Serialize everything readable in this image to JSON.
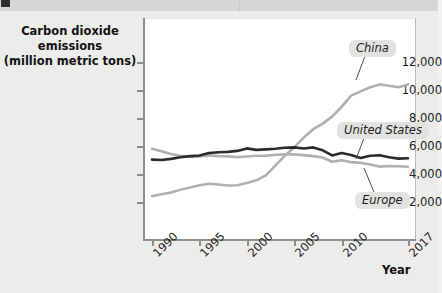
{
  "figure": {
    "y_axis_title_line1": "Carbon dioxide emissions",
    "y_axis_title_line2": "(million metric tons)",
    "x_axis_title": "Year"
  },
  "callouts": {
    "china": "China",
    "united_states": "United States",
    "europe": "Europe"
  },
  "chart_data": {
    "type": "line",
    "title": "Carbon dioxide emissions (million metric tons)",
    "xlabel": "Year",
    "ylabel": "Carbon dioxide emissions (million metric tons)",
    "xlim": [
      1990,
      2017
    ],
    "ylim": [
      0,
      13000
    ],
    "xticks": [
      1990,
      1995,
      2000,
      2005,
      2010,
      2017
    ],
    "xtick_labels": [
      "1990",
      "1995",
      "2000",
      "2005",
      "2010",
      "2017"
    ],
    "yticks": [
      2000,
      4000,
      6000,
      8000,
      10000,
      12000
    ],
    "ytick_labels": [
      "2,000",
      "4,000",
      "6,000",
      "8,000",
      "10,000",
      "12,000"
    ],
    "grid": false,
    "legend_position": "inline-callouts",
    "x": [
      1990,
      1991,
      1992,
      1993,
      1994,
      1995,
      1996,
      1997,
      1998,
      1999,
      2000,
      2001,
      2002,
      2003,
      2004,
      2005,
      2006,
      2007,
      2008,
      2009,
      2010,
      2011,
      2012,
      2013,
      2014,
      2015,
      2016,
      2017
    ],
    "series": [
      {
        "name": "China",
        "color": "#b0b0ae",
        "values": [
          2420,
          2550,
          2680,
          2880,
          3030,
          3200,
          3300,
          3250,
          3180,
          3200,
          3350,
          3550,
          3900,
          4600,
          5300,
          5900,
          6600,
          7200,
          7600,
          8100,
          8800,
          9600,
          9900,
          10200,
          10400,
          10300,
          10200,
          10400
        ]
      },
      {
        "name": "United States",
        "color": "#2b2b2b",
        "values": [
          5030,
          5000,
          5080,
          5200,
          5280,
          5320,
          5500,
          5560,
          5580,
          5650,
          5830,
          5720,
          5760,
          5800,
          5870,
          5900,
          5820,
          5900,
          5690,
          5330,
          5500,
          5350,
          5150,
          5300,
          5340,
          5200,
          5100,
          5130
        ]
      },
      {
        "name": "Europe",
        "color": "#b0b0ae",
        "values": [
          5800,
          5620,
          5420,
          5300,
          5220,
          5250,
          5330,
          5280,
          5260,
          5210,
          5250,
          5300,
          5300,
          5380,
          5400,
          5400,
          5350,
          5280,
          5180,
          4870,
          4980,
          4850,
          4790,
          4680,
          4530,
          4570,
          4560,
          4520
        ]
      }
    ],
    "annotations": [
      {
        "text": "China",
        "x": 2012,
        "y": 12100
      },
      {
        "text": "United States",
        "x": 2011,
        "y": 6900
      },
      {
        "text": "Europe",
        "x": 2012,
        "y": 2950
      }
    ]
  }
}
